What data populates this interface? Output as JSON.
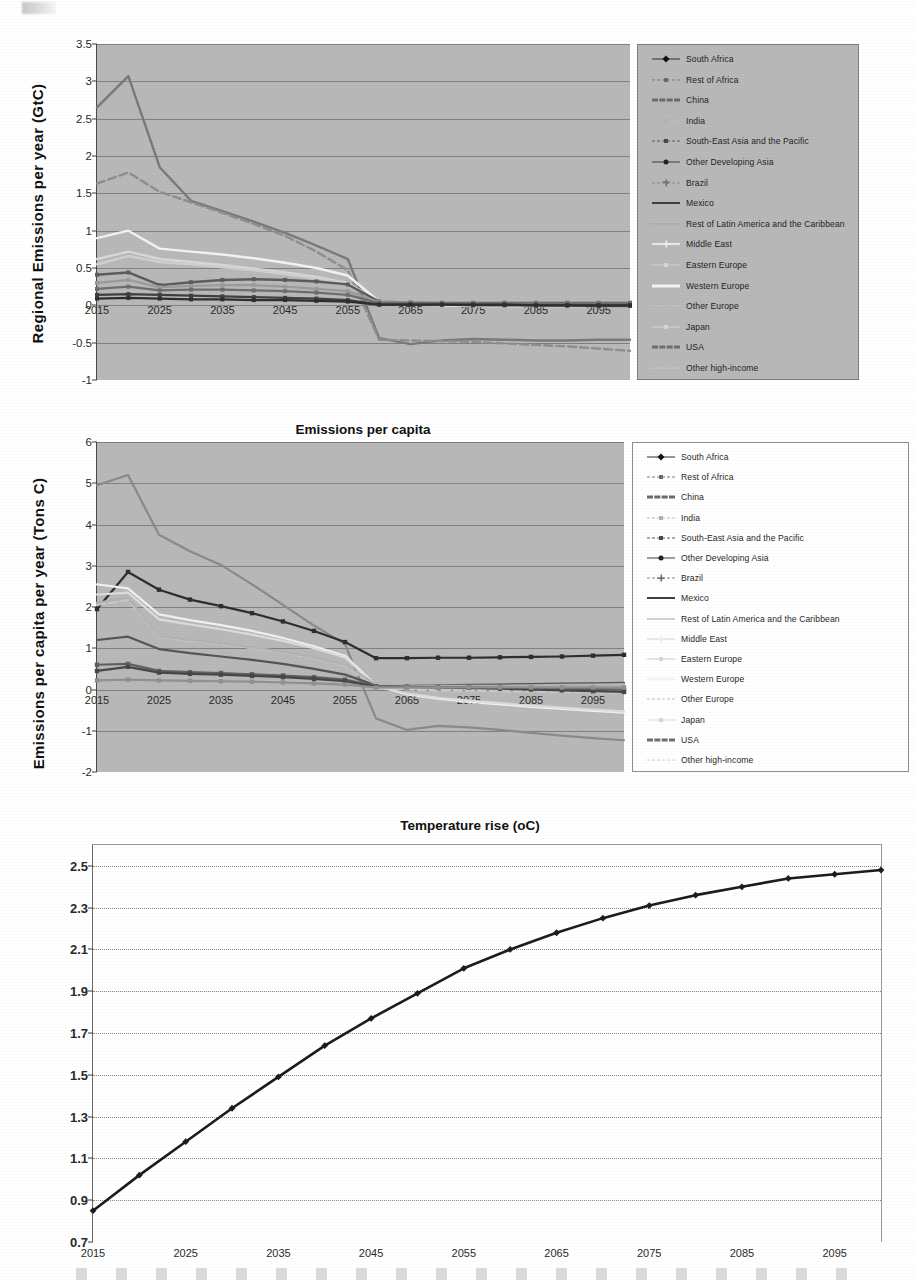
{
  "document": {
    "kind": "scanned-figure-page",
    "charts_count": 3
  },
  "legend_entries": [
    "South Africa",
    "Rest of Africa",
    "China",
    "India",
    "South-East Asia and the Pacific",
    "Other Developing Asia",
    "Brazil",
    "Mexico",
    "Rest of Latin America and the Caribbean",
    "Middle East",
    "Eastern Europe",
    "Western Europe",
    "Other Europe",
    "Japan",
    "USA",
    "Other high-income"
  ],
  "chart_data": [
    {
      "id": "regional-emissions",
      "type": "line",
      "title": "",
      "xlabel": "",
      "ylabel": "Regional  Emissions per  year  (GtC)",
      "xlim": [
        2015,
        2100
      ],
      "ylim": [
        -1,
        3.5
      ],
      "xticks": [
        2015,
        2025,
        2035,
        2045,
        2055,
        2065,
        2075,
        2085,
        2095
      ],
      "yticks": [
        3.5,
        3,
        2.5,
        2,
        1.5,
        1,
        0.5,
        0,
        -0.5,
        -1
      ],
      "grid": true,
      "legend_position": "right",
      "x": [
        2015,
        2020,
        2025,
        2030,
        2035,
        2040,
        2045,
        2050,
        2055,
        2060,
        2065,
        2070,
        2075,
        2080,
        2085,
        2090,
        2095,
        2100
      ],
      "series": [
        {
          "name": "China",
          "color": "#7a7a7a",
          "values": [
            2.65,
            3.07,
            1.85,
            1.4,
            1.26,
            1.12,
            0.97,
            0.8,
            0.62,
            -0.44,
            -0.52,
            -0.47,
            -0.45,
            -0.46,
            -0.47,
            -0.47,
            -0.46,
            -0.46
          ]
        },
        {
          "name": "USA",
          "color": "#8e8e8e",
          "values": [
            1.63,
            1.78,
            1.52,
            1.38,
            1.24,
            1.09,
            0.93,
            0.72,
            0.47,
            -0.46,
            -0.47,
            -0.48,
            -0.49,
            -0.51,
            -0.53,
            -0.55,
            -0.58,
            -0.61
          ]
        },
        {
          "name": "Western Europe",
          "color": "#f2f2f2",
          "values": [
            0.9,
            1.0,
            0.76,
            0.72,
            0.68,
            0.63,
            0.57,
            0.5,
            0.4,
            0.05,
            0.02,
            0.0,
            -0.01,
            -0.01,
            -0.01,
            -0.01,
            -0.01,
            -0.01
          ]
        },
        {
          "name": "Middle East",
          "color": "#d8d8d8",
          "values": [
            0.62,
            0.72,
            0.62,
            0.58,
            0.54,
            0.49,
            0.44,
            0.38,
            0.3,
            0.04,
            0.02,
            0.01,
            0.01,
            0.01,
            0.01,
            0.01,
            0.01,
            0.01
          ]
        },
        {
          "name": "Rest of Africa",
          "color": "#cfcfcf",
          "values": [
            0.55,
            0.66,
            0.58,
            0.55,
            0.51,
            0.47,
            0.42,
            0.36,
            0.29,
            0.04,
            0.03,
            0.02,
            0.02,
            0.02,
            0.02,
            0.02,
            0.02,
            0.02
          ]
        },
        {
          "name": "Other Developing Asia",
          "color": "#5c5c5c",
          "values": [
            0.41,
            0.44,
            0.27,
            0.31,
            0.34,
            0.35,
            0.34,
            0.32,
            0.28,
            0.05,
            0.04,
            0.03,
            0.02,
            0.01,
            0.0,
            0.0,
            -0.01,
            -0.01
          ]
        },
        {
          "name": "India",
          "color": "#9b9b9b",
          "values": [
            0.3,
            0.34,
            0.24,
            0.26,
            0.27,
            0.27,
            0.25,
            0.22,
            0.19,
            0.04,
            0.04,
            0.04,
            0.04,
            0.04,
            0.04,
            0.04,
            0.04,
            0.04
          ]
        },
        {
          "name": "South-East Asia and the Pacific",
          "color": "#6e6e6e",
          "values": [
            0.22,
            0.25,
            0.2,
            0.21,
            0.21,
            0.2,
            0.19,
            0.17,
            0.14,
            0.03,
            0.03,
            0.03,
            0.03,
            0.03,
            0.03,
            0.03,
            0.03,
            0.03
          ]
        },
        {
          "name": "Eastern Europe",
          "color": "#3f3f3f",
          "values": [
            0.14,
            0.15,
            0.14,
            0.13,
            0.12,
            0.11,
            0.1,
            0.09,
            0.07,
            0.01,
            0.01,
            0.01,
            0.0,
            0.0,
            0.0,
            0.0,
            0.0,
            0.0
          ]
        },
        {
          "name": "South Africa",
          "color": "#2e2e2e",
          "values": [
            0.09,
            0.1,
            0.09,
            0.08,
            0.08,
            0.07,
            0.07,
            0.06,
            0.05,
            0.01,
            0.01,
            0.01,
            0.01,
            0.01,
            0.0,
            0.0,
            0.0,
            0.0
          ]
        }
      ]
    },
    {
      "id": "emissions-per-capita",
      "type": "line",
      "title": "Emissions per capita",
      "xlabel": "",
      "ylabel": "Emissions per capita  per year  (Tons C)",
      "xlim": [
        2015,
        2100
      ],
      "ylim": [
        -2,
        6
      ],
      "xticks": [
        2015,
        2025,
        2035,
        2045,
        2055,
        2065,
        2075,
        2085,
        2095
      ],
      "yticks": [
        6,
        5,
        4,
        3,
        2,
        1,
        0,
        -1,
        -2
      ],
      "grid": true,
      "legend_position": "right",
      "x": [
        2015,
        2020,
        2025,
        2030,
        2035,
        2040,
        2045,
        2050,
        2055,
        2060,
        2065,
        2070,
        2075,
        2080,
        2085,
        2090,
        2095,
        2100
      ],
      "series": [
        {
          "name": "USA",
          "color": "#8a8a8a",
          "values": [
            4.95,
            5.2,
            3.75,
            3.35,
            3.02,
            2.55,
            2.05,
            1.55,
            1.1,
            -0.7,
            -0.98,
            -0.88,
            -0.92,
            -0.98,
            -1.05,
            -1.12,
            -1.18,
            -1.23
          ]
        },
        {
          "name": "South Africa",
          "color": "#2e2e2e",
          "values": [
            1.95,
            2.85,
            2.42,
            2.18,
            2.02,
            1.85,
            1.65,
            1.42,
            1.15,
            0.76,
            0.76,
            0.77,
            0.77,
            0.78,
            0.79,
            0.8,
            0.82,
            0.84
          ]
        },
        {
          "name": "Western Europe",
          "color": "#f0f0f0",
          "values": [
            2.55,
            2.45,
            1.82,
            1.68,
            1.56,
            1.42,
            1.25,
            1.05,
            0.82,
            0.1,
            -0.12,
            -0.22,
            -0.3,
            -0.36,
            -0.42,
            -0.47,
            -0.52,
            -0.56
          ]
        },
        {
          "name": "Japan",
          "color": "#dcdcdc",
          "values": [
            2.3,
            2.35,
            1.7,
            1.58,
            1.46,
            1.33,
            1.18,
            1.0,
            0.78,
            0.08,
            -0.1,
            -0.2,
            -0.27,
            -0.33,
            -0.39,
            -0.44,
            -0.49,
            -0.53
          ]
        },
        {
          "name": "Other high-income",
          "color": "#c9c9c9",
          "values": [
            2.05,
            2.18,
            1.28,
            1.18,
            1.1,
            1.0,
            0.9,
            0.76,
            0.58,
            0.05,
            0.0,
            -0.02,
            -0.03,
            -0.04,
            -0.05,
            -0.06,
            -0.07,
            -0.08
          ]
        },
        {
          "name": "Mexico",
          "color": "#555555",
          "values": [
            1.2,
            1.28,
            0.98,
            0.88,
            0.8,
            0.72,
            0.62,
            0.5,
            0.36,
            0.1,
            0.1,
            0.1,
            0.11,
            0.12,
            0.13,
            0.14,
            0.15,
            0.16
          ]
        },
        {
          "name": "Middle East",
          "color": "#b3b3b3",
          "values": [
            2.1,
            2.22,
            1.3,
            1.2,
            1.12,
            1.02,
            0.92,
            0.78,
            0.6,
            0.12,
            0.1,
            0.09,
            0.09,
            0.09,
            0.1,
            0.11,
            0.12,
            0.13
          ]
        },
        {
          "name": "Other Developing Asia",
          "color": "#606060",
          "values": [
            0.6,
            0.62,
            0.45,
            0.42,
            0.4,
            0.37,
            0.34,
            0.3,
            0.24,
            0.08,
            0.07,
            0.06,
            0.05,
            0.04,
            0.03,
            0.02,
            0.01,
            0.0
          ]
        },
        {
          "name": "Brazil",
          "color": "#474747",
          "values": [
            0.45,
            0.55,
            0.41,
            0.38,
            0.36,
            0.33,
            0.3,
            0.26,
            0.2,
            0.07,
            0.06,
            0.05,
            0.04,
            0.02,
            0.0,
            -0.02,
            -0.04,
            -0.06
          ]
        },
        {
          "name": "Eastern Europe",
          "color": "#909090",
          "values": [
            0.22,
            0.24,
            0.22,
            0.21,
            0.2,
            0.19,
            0.17,
            0.15,
            0.12,
            0.05,
            0.05,
            0.05,
            0.05,
            0.05,
            0.05,
            0.05,
            0.05,
            0.05
          ]
        }
      ]
    },
    {
      "id": "temperature-rise",
      "type": "line",
      "title": "Temperature rise (oC)",
      "xlabel": "",
      "ylabel": "",
      "xlim": [
        2015,
        2100
      ],
      "ylim": [
        0.7,
        2.6
      ],
      "xticks": [
        2015,
        2025,
        2035,
        2045,
        2055,
        2065,
        2075,
        2085,
        2095
      ],
      "yticks": [
        2.5,
        2.3,
        2.1,
        1.9,
        1.7,
        1.5,
        1.3,
        1.1,
        0.9,
        0.7
      ],
      "grid": true,
      "legend_position": "none",
      "x": [
        2015,
        2020,
        2025,
        2030,
        2035,
        2040,
        2045,
        2050,
        2055,
        2060,
        2065,
        2070,
        2075,
        2080,
        2085,
        2090,
        2095,
        2100
      ],
      "series": [
        {
          "name": "Temperature rise",
          "color": "#1c1c1c",
          "values": [
            0.85,
            1.02,
            1.18,
            1.34,
            1.49,
            1.64,
            1.77,
            1.89,
            2.01,
            2.1,
            2.18,
            2.25,
            2.31,
            2.36,
            2.4,
            2.44,
            2.46,
            2.48
          ]
        }
      ]
    }
  ]
}
